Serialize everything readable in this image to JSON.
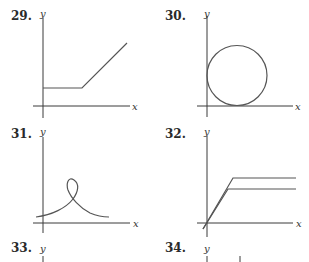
{
  "problems": [
    {
      "number": "29.",
      "x_label": "x",
      "y_label": "y",
      "description": "horizontal segment then rising line"
    },
    {
      "number": "30.",
      "x_label": "x",
      "y_label": "y",
      "description": "circle tangent to both axes"
    },
    {
      "number": "31.",
      "x_label": "x",
      "y_label": "y",
      "description": "curve with a loop at the top"
    },
    {
      "number": "32.",
      "x_label": "x",
      "y_label": "y",
      "description": "two ramps leveling off to horizontal lines"
    },
    {
      "number": "33.",
      "x_label": "",
      "y_label": "y",
      "description": "graph cut off"
    },
    {
      "number": "34.",
      "x_label": "",
      "y_label": "y",
      "description": "graph cut off"
    }
  ]
}
